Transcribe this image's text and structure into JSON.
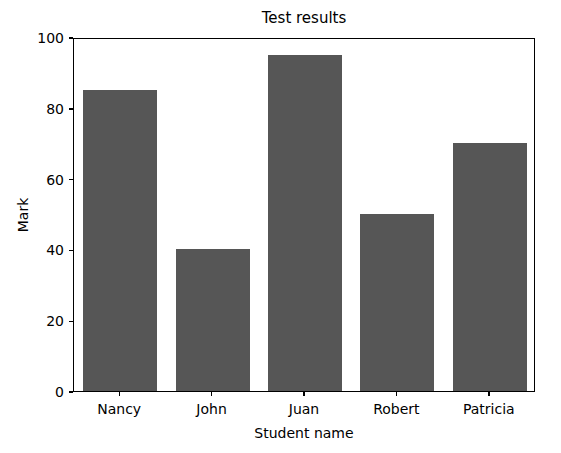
{
  "chart_data": {
    "type": "bar",
    "title": "Test results",
    "xlabel": "Student name",
    "ylabel": "Mark",
    "categories": [
      "Nancy",
      "John",
      "Juan",
      "Robert",
      "Patricia"
    ],
    "values": [
      85,
      40,
      95,
      50,
      70
    ],
    "ylim": [
      0,
      100
    ],
    "yticks": [
      0,
      20,
      40,
      60,
      80,
      100
    ],
    "ytick_labels": [
      "0",
      "20",
      "40",
      "60",
      "80",
      "100"
    ],
    "grid": false,
    "legend": null,
    "bar_color": "#565656",
    "axes_color": "#000000",
    "background_color": "#ffffff"
  }
}
